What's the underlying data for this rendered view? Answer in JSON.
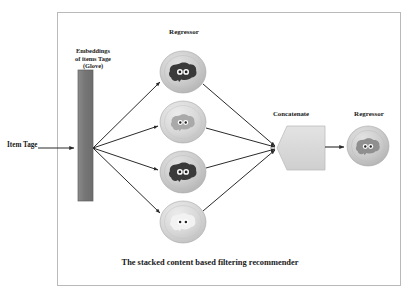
{
  "figure": {
    "caption": "The stacked content based filtering recommender",
    "border_color": "#b9b9bc",
    "background_color": "#ffffff"
  },
  "labels": {
    "item_tags": "Item Tage",
    "embeddings": "Embeddings of items Tage (Glove)",
    "embeddings_line1": "Embeddings",
    "embeddings_line2": "of items Tage",
    "embeddings_line3": "(Glove)",
    "regressor_layer": "Regressor",
    "concatenate": "Concatenate",
    "regressor_final": "Regressor"
  },
  "colors": {
    "embedding_bar": "#7c7c7c",
    "embedding_bar_edge": "#5e5e5e",
    "node_fill": "#c9c9c9",
    "node_fill_light": "#d6d6d6",
    "node_edge": "#a8a8a8",
    "brain_dark": "#3a3a3a",
    "brain_mid": "#9a9a9a",
    "brain_light": "#ececec",
    "concat_fill": "#d8d8d8",
    "concat_edge": "#bdbdbd",
    "arrow": "#2a2a2a"
  },
  "nodes": {
    "embedding_bar": {
      "name": "embedding-bar",
      "x": 78,
      "y": 70,
      "width": 15,
      "height": 131
    },
    "hidden_regressors": [
      {
        "id": "regressor-1",
        "cx": 183,
        "cy": 72,
        "rx": 23,
        "ry": 21,
        "brain": "dark"
      },
      {
        "id": "regressor-2",
        "cx": 183,
        "cy": 122,
        "rx": 23,
        "ry": 21,
        "brain": "mid"
      },
      {
        "id": "regressor-3",
        "cx": 183,
        "cy": 172,
        "rx": 23,
        "ry": 21,
        "brain": "dark"
      },
      {
        "id": "regressor-4",
        "cx": 183,
        "cy": 222,
        "rx": 23,
        "ry": 21,
        "brain": "light"
      }
    ],
    "concatenate": {
      "id": "concatenate-block",
      "x": 277,
      "y": 126,
      "width": 48,
      "height": 44
    },
    "output_regressor": {
      "id": "output-regressor",
      "cx": 368,
      "cy": 146,
      "rx": 21,
      "ry": 20,
      "brain": "mid"
    }
  },
  "edges": {
    "input_to_bar": {
      "from_x": 38,
      "from_y": 148,
      "to_x": 76,
      "to_y": 148
    },
    "fan_origin": {
      "x": 93,
      "y": 148
    },
    "merge_point": {
      "x": 277,
      "y": 148
    },
    "concat_to_output": {
      "from_x": 325,
      "from_y": 147,
      "to_x": 346,
      "to_y": 147
    },
    "fan_out_count": 4,
    "fan_in_count": 4
  }
}
